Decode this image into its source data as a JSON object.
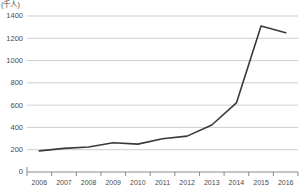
{
  "chart_data": {
    "type": "line",
    "title": "",
    "subtitle": "",
    "xlabel": "",
    "ylabel": "",
    "unit_label": "(千人)",
    "categories": [
      "2006",
      "2007",
      "2008",
      "2009",
      "2010",
      "2011",
      "2012",
      "2013",
      "2014",
      "2015",
      "2016"
    ],
    "series": [
      {
        "name": "",
        "values": [
          190,
          212,
          225,
          262,
          250,
          298,
          322,
          422,
          620,
          1310,
          1250
        ]
      }
    ],
    "x": [
      "2006",
      "2007",
      "2008",
      "2009",
      "2010",
      "2011",
      "2012",
      "2013",
      "2014",
      "2015",
      "2016"
    ],
    "ylim": [
      0,
      1400
    ],
    "yticks": [
      "0",
      "200",
      "400",
      "600",
      "800",
      "1000",
      "1200",
      "1400"
    ],
    "ytick_values": [
      0,
      200,
      400,
      600,
      800,
      1000,
      1200,
      1400
    ],
    "grid": true,
    "legend": false,
    "legend_position": "none",
    "line_color": "#39393b",
    "grid_color": "#b9b9b9",
    "axis_color": "#6d6d6d"
  }
}
